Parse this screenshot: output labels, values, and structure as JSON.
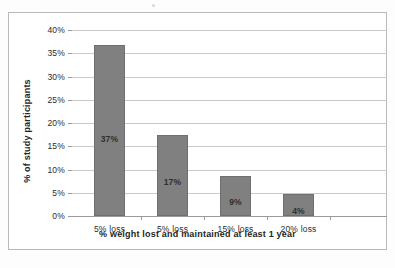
{
  "chart_data": {
    "type": "bar",
    "title": "",
    "xlabel": "% weight lost and maintained at least 1 year",
    "ylabel": "% of study participants",
    "categories": [
      "5% loss",
      "5% loss",
      "15% loss",
      "20% loss"
    ],
    "values": [
      36.7,
      17.4,
      8.7,
      4.7
    ],
    "data_labels": [
      "37%",
      "17%",
      "9%",
      "4%"
    ],
    "ylim": [
      0,
      40
    ],
    "ytick_values": [
      0,
      5,
      10,
      15,
      20,
      25,
      30,
      35,
      40
    ],
    "ytick_labels": [
      "0%",
      "5%",
      "10%",
      "15%",
      "20%",
      "25%",
      "30%",
      "35%",
      "40%"
    ],
    "grid": "horizontal",
    "legend": "none",
    "bar_color": "#808080",
    "gridline_color": "#c9c9c9",
    "axis_color": "#9a9a9a",
    "text_color": "#2b2b2b"
  }
}
